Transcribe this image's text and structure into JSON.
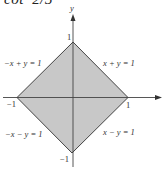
{
  "header": {
    "partial_text": "cot  2/3"
  },
  "diagram": {
    "axes": {
      "x_label": "",
      "y_label": "y"
    },
    "ticks": {
      "x_pos": "1",
      "x_neg": "−1",
      "y_pos": "1",
      "y_neg": "−1"
    },
    "region": {
      "shape": "square (diamond)",
      "vertices": [
        [
          1,
          0
        ],
        [
          0,
          1
        ],
        [
          -1,
          0
        ],
        [
          0,
          -1
        ]
      ],
      "fill": "#c8c8c8",
      "stroke": "#444444"
    },
    "edge_labels": {
      "top_right": "x + y = 1",
      "top_left": "−x + y = 1",
      "bottom_left": "−x − y = 1",
      "bottom_right": "x − y = 1"
    }
  }
}
